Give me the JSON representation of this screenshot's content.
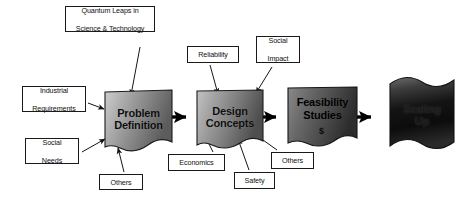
{
  "diagram": {
    "colors": {
      "outline": "#1a1a1a",
      "arrow": "#000000",
      "box_fill": "#ffffff",
      "stage_light": "#d8d8d8",
      "stage_mid": "#8f8f8f",
      "stage_dark": "#3a3a3a",
      "stage_darkest": "#111111"
    },
    "stages": [
      {
        "id": "problem-definition",
        "line1": "Problem",
        "line2": "Definition",
        "tone": "light"
      },
      {
        "id": "design-concepts",
        "line1": "Design",
        "line2": "Concepts",
        "tone": "light"
      },
      {
        "id": "feasibility-studies",
        "line1": "Feasibility",
        "line2": "Studies",
        "tone": "dark",
        "badge": "$"
      },
      {
        "id": "scaling-up",
        "line1": "Scaling",
        "line2": "Up",
        "tone": "darkest"
      }
    ],
    "inputs": [
      {
        "id": "quantum-leaps",
        "line1": "Quantum Leaps in",
        "line2": "Science & Technology",
        "target": "problem-definition"
      },
      {
        "id": "industrial-requirements",
        "line1": "Industrial",
        "line2": "Requirements",
        "target": "problem-definition"
      },
      {
        "id": "social-needs",
        "line1": "Social",
        "line2": "Needs",
        "target": "problem-definition"
      },
      {
        "id": "others-problem",
        "line1": "Others",
        "line2": "",
        "target": "problem-definition"
      },
      {
        "id": "reliability",
        "line1": "Reliability",
        "line2": "",
        "target": "design-concepts"
      },
      {
        "id": "social-impact",
        "line1": "Social",
        "line2": "Impact",
        "target": "design-concepts"
      },
      {
        "id": "economics",
        "line1": "Economics",
        "line2": "",
        "target": "design-concepts"
      },
      {
        "id": "safety",
        "line1": "Safety",
        "line2": "",
        "target": "design-concepts"
      },
      {
        "id": "others-design",
        "line1": "Others",
        "line2": "",
        "target": "design-concepts"
      }
    ],
    "flow_arrows": [
      {
        "from": "problem-definition",
        "to": "design-concepts"
      },
      {
        "from": "design-concepts",
        "to": "feasibility-studies"
      },
      {
        "from": "feasibility-studies",
        "to": "scaling-up"
      }
    ]
  }
}
